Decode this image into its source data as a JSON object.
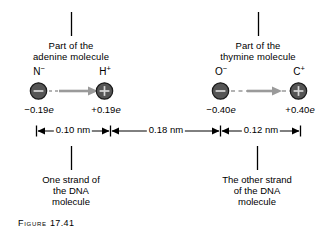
{
  "figure": {
    "caption_prefix": "Figure",
    "caption_number": "17.41",
    "caption_full": "FIGURE 17.41"
  },
  "colors": {
    "atom_fill": "#555555",
    "atom_stroke": "#1a1a1a",
    "glyph": "#d8d8d8",
    "arrow": "#9a9a9a",
    "line": "#000000",
    "background": "#ffffff"
  },
  "top_labels": [
    {
      "id": "adenine",
      "line1": "Part of the",
      "line2": "adenine molecule"
    },
    {
      "id": "thymine",
      "line1": "Part of the",
      "line2": "thymine molecule"
    }
  ],
  "atoms": [
    {
      "id": "nitrogen",
      "element": "N",
      "charge_sign": "−",
      "glyph": "−",
      "charge_value": "−0.19",
      "charge_unit": "e"
    },
    {
      "id": "hydrogen",
      "element": "H",
      "charge_sign": "+",
      "glyph": "+",
      "charge_value": "+0.19",
      "charge_unit": "e"
    },
    {
      "id": "oxygen",
      "element": "O",
      "charge_sign": "−",
      "glyph": "−",
      "charge_value": "−0.40",
      "charge_unit": "e"
    },
    {
      "id": "carbon",
      "element": "C",
      "charge_sign": "+",
      "glyph": "+",
      "charge_value": "+0.40",
      "charge_unit": "e"
    }
  ],
  "dimensions": [
    {
      "id": "adenine-bond",
      "label": "0.10 nm"
    },
    {
      "id": "hydrogen-bond-gap",
      "label": "0.18 nm"
    },
    {
      "id": "thymine-bond",
      "label": "0.12 nm"
    }
  ],
  "bottom_labels": [
    {
      "id": "one-strand",
      "line1": "One strand of",
      "line2": "the DNA",
      "line3": "molecule"
    },
    {
      "id": "other-strand",
      "line1": "The other strand",
      "line2": "of the DNA",
      "line3": "molecule"
    }
  ]
}
